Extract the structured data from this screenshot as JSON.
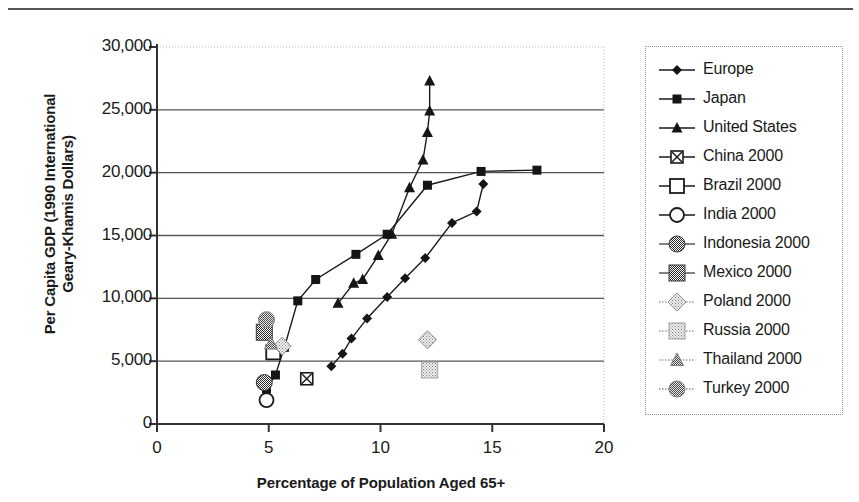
{
  "chart_data": {
    "type": "scatter",
    "title": "",
    "xlabel": "Percentage of Population Aged 65+",
    "ylabel": "Per Capita GDP (1990 International Geary-Khamis Dollars)",
    "ylabel_line1": "Per Capita GDP (1990 International",
    "ylabel_line2": "Geary-Khamis Dollars)",
    "xlim": [
      0,
      20
    ],
    "ylim": [
      0,
      30000
    ],
    "xticks": [
      0,
      5,
      10,
      15,
      20
    ],
    "xtick_labels": [
      "0",
      "5",
      "10",
      "15",
      "20"
    ],
    "yticks": [
      0,
      5000,
      10000,
      15000,
      20000,
      25000,
      30000
    ],
    "ytick_labels": [
      "0",
      "5,000",
      "10,000",
      "15,000",
      "20,000",
      "25,000",
      "30,000"
    ],
    "grid": "horizontal",
    "legend_position": "right-outside",
    "series": [
      {
        "name": "Europe",
        "marker": "filled-diamond",
        "line": true,
        "color": "#1a1a1a",
        "points": [
          {
            "x": 7.8,
            "y": 4600
          },
          {
            "x": 8.3,
            "y": 5600
          },
          {
            "x": 8.7,
            "y": 6800
          },
          {
            "x": 9.4,
            "y": 8400
          },
          {
            "x": 10.3,
            "y": 10100
          },
          {
            "x": 11.1,
            "y": 11600
          },
          {
            "x": 12.0,
            "y": 13200
          },
          {
            "x": 13.2,
            "y": 16000
          },
          {
            "x": 14.3,
            "y": 16900
          },
          {
            "x": 14.6,
            "y": 19100
          }
        ]
      },
      {
        "name": "Japan",
        "marker": "filled-square",
        "line": true,
        "color": "#1a1a1a",
        "points": [
          {
            "x": 4.9,
            "y": 2800
          },
          {
            "x": 5.3,
            "y": 3900
          },
          {
            "x": 5.7,
            "y": 6100
          },
          {
            "x": 6.3,
            "y": 9800
          },
          {
            "x": 7.1,
            "y": 11500
          },
          {
            "x": 8.9,
            "y": 13500
          },
          {
            "x": 10.3,
            "y": 15100
          },
          {
            "x": 12.1,
            "y": 19000
          },
          {
            "x": 14.5,
            "y": 20100
          },
          {
            "x": 17.0,
            "y": 20200
          }
        ]
      },
      {
        "name": "United States",
        "marker": "filled-triangle",
        "line": true,
        "color": "#1a1a1a",
        "points": [
          {
            "x": 8.1,
            "y": 9600
          },
          {
            "x": 8.8,
            "y": 11200
          },
          {
            "x": 9.2,
            "y": 11500
          },
          {
            "x": 9.9,
            "y": 13400
          },
          {
            "x": 10.5,
            "y": 15100
          },
          {
            "x": 11.3,
            "y": 18800
          },
          {
            "x": 11.9,
            "y": 21000
          },
          {
            "x": 12.1,
            "y": 23200
          },
          {
            "x": 12.2,
            "y": 24900
          },
          {
            "x": 12.2,
            "y": 27300
          }
        ]
      },
      {
        "name": "China 2000",
        "marker": "x-square",
        "line": false,
        "color": "#1a1a1a",
        "points": [
          {
            "x": 6.7,
            "y": 3600
          }
        ]
      },
      {
        "name": "Brazil 2000",
        "marker": "open-square",
        "line": false,
        "color": "#1a1a1a",
        "points": [
          {
            "x": 5.2,
            "y": 5700
          }
        ]
      },
      {
        "name": "India 2000",
        "marker": "open-circle",
        "line": false,
        "color": "#1a1a1a",
        "points": [
          {
            "x": 4.9,
            "y": 1900
          }
        ]
      },
      {
        "name": "Indonesia 2000",
        "marker": "shaded-circle",
        "line": false,
        "color": "#5a5a5a",
        "points": [
          {
            "x": 4.8,
            "y": 3300
          }
        ]
      },
      {
        "name": "Mexico 2000",
        "marker": "shaded-square",
        "line": false,
        "color": "#5a5a5a",
        "points": [
          {
            "x": 4.8,
            "y": 7300
          }
        ]
      },
      {
        "name": "Poland 2000",
        "marker": "light-diamond",
        "line": false,
        "color": "#9a9a9a",
        "points": [
          {
            "x": 5.6,
            "y": 6200
          },
          {
            "x": 12.1,
            "y": 6700
          }
        ]
      },
      {
        "name": "Russia 2000",
        "marker": "light-square",
        "line": false,
        "color": "#9a9a9a",
        "points": [
          {
            "x": 12.2,
            "y": 4300
          }
        ]
      },
      {
        "name": "Thailand 2000",
        "marker": "light-triangle",
        "line": false,
        "color": "#9a9a9a",
        "points": [
          {
            "x": 5.1,
            "y": 6400
          }
        ]
      },
      {
        "name": "Turkey 2000",
        "marker": "light-circle",
        "line": false,
        "color": "#8a8a8a",
        "points": [
          {
            "x": 4.9,
            "y": 8300
          }
        ]
      }
    ]
  },
  "legend": {
    "items": [
      {
        "label": "Europe",
        "marker": "filled-diamond"
      },
      {
        "label": "Japan",
        "marker": "filled-square"
      },
      {
        "label": "United States",
        "marker": "filled-triangle"
      },
      {
        "label": "China 2000",
        "marker": "x-square"
      },
      {
        "label": "Brazil 2000",
        "marker": "open-square"
      },
      {
        "label": "India 2000",
        "marker": "open-circle"
      },
      {
        "label": "Indonesia 2000",
        "marker": "shaded-circle"
      },
      {
        "label": "Mexico 2000",
        "marker": "shaded-square"
      },
      {
        "label": "Poland 2000",
        "marker": "light-diamond"
      },
      {
        "label": "Russia 2000",
        "marker": "light-square"
      },
      {
        "label": "Thailand 2000",
        "marker": "light-triangle"
      },
      {
        "label": "Turkey 2000",
        "marker": "light-circle"
      }
    ]
  }
}
